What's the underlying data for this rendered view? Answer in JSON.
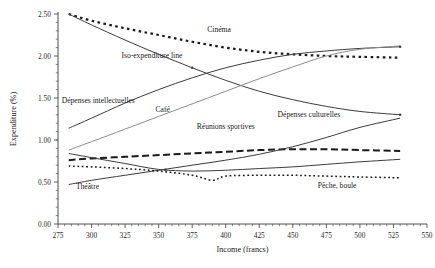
{
  "chart_data": {
    "type": "line",
    "title": "",
    "xlabel": "Income (francs)",
    "ylabel": "Expenditure (%)",
    "xlim": [
      275,
      550
    ],
    "ylim": [
      0.0,
      2.5
    ],
    "xticks": [
      275,
      300,
      325,
      350,
      375,
      400,
      425,
      450,
      475,
      500,
      525,
      550
    ],
    "yticks": [
      "0.00",
      "0.50",
      "1.00",
      "1.50",
      "2.00",
      "2.50"
    ],
    "ytick_values": [
      0.0,
      0.5,
      1.0,
      1.5,
      2.0,
      2.5
    ],
    "grid": false,
    "legend": "inline-annotations",
    "series": [
      {
        "name": "Cinéma",
        "style": "dotted-thick",
        "color": "#1a1a1a",
        "label_x": 395,
        "label_y": 2.28,
        "points": [
          [
            283,
            2.5
          ],
          [
            300,
            2.42
          ],
          [
            325,
            2.33
          ],
          [
            350,
            2.25
          ],
          [
            375,
            2.17
          ],
          [
            400,
            2.1
          ],
          [
            425,
            2.05
          ],
          [
            450,
            2.02
          ],
          [
            475,
            2.0
          ],
          [
            500,
            1.99
          ],
          [
            530,
            1.98
          ]
        ]
      },
      {
        "name": "Iso-expenditure line",
        "style": "solid",
        "color": "#3c3c3c",
        "label_x": 345,
        "label_y": 1.98,
        "points": [
          [
            283,
            2.5
          ],
          [
            300,
            2.37
          ],
          [
            325,
            2.19
          ],
          [
            350,
            2.02
          ],
          [
            375,
            1.86
          ],
          [
            400,
            1.71
          ],
          [
            425,
            1.58
          ],
          [
            450,
            1.48
          ],
          [
            475,
            1.4
          ],
          [
            500,
            1.34
          ],
          [
            530,
            1.3
          ]
        ]
      },
      {
        "name": "Dépenses intellectuelles",
        "style": "solid",
        "color": "#3c3c3c",
        "label_x": 305,
        "label_y": 1.44,
        "points": [
          [
            283,
            1.14
          ],
          [
            300,
            1.26
          ],
          [
            325,
            1.44
          ],
          [
            350,
            1.6
          ],
          [
            375,
            1.74
          ],
          [
            400,
            1.86
          ],
          [
            425,
            1.95
          ],
          [
            450,
            2.02
          ],
          [
            475,
            2.06
          ],
          [
            500,
            2.09
          ],
          [
            530,
            2.11
          ]
        ]
      },
      {
        "name": "Café",
        "style": "solid-light",
        "color": "#8d8d8d",
        "label_x": 353,
        "label_y": 1.33,
        "points": [
          [
            283,
            0.88
          ],
          [
            300,
            0.98
          ],
          [
            325,
            1.13
          ],
          [
            350,
            1.28
          ],
          [
            375,
            1.43
          ],
          [
            400,
            1.58
          ],
          [
            425,
            1.73
          ],
          [
            450,
            1.87
          ],
          [
            475,
            2.0
          ],
          [
            500,
            2.08
          ],
          [
            530,
            2.12
          ]
        ]
      },
      {
        "name": "Réunions sportives",
        "style": "dashed",
        "color": "#1a1a1a",
        "label_x": 400,
        "label_y": 1.13,
        "points": [
          [
            283,
            0.76
          ],
          [
            300,
            0.78
          ],
          [
            325,
            0.8
          ],
          [
            350,
            0.82
          ],
          [
            375,
            0.84
          ],
          [
            400,
            0.86
          ],
          [
            425,
            0.88
          ],
          [
            450,
            0.89
          ],
          [
            475,
            0.89
          ],
          [
            500,
            0.88
          ],
          [
            530,
            0.87
          ]
        ]
      },
      {
        "name": "Dépenses culturelles",
        "style": "solid",
        "color": "#3c3c3c",
        "label_x": 462,
        "label_y": 1.27,
        "points": [
          [
            283,
            0.47
          ],
          [
            300,
            0.52
          ],
          [
            325,
            0.58
          ],
          [
            350,
            0.64
          ],
          [
            375,
            0.7
          ],
          [
            400,
            0.76
          ],
          [
            425,
            0.83
          ],
          [
            450,
            0.92
          ],
          [
            475,
            1.03
          ],
          [
            500,
            1.15
          ],
          [
            530,
            1.26
          ]
        ]
      },
      {
        "name": "Théâtre",
        "style": "solid",
        "color": "#3c3c3c",
        "label_x": 297,
        "label_y": 0.42,
        "points": [
          [
            283,
            0.84
          ],
          [
            300,
            0.79
          ],
          [
            325,
            0.72
          ],
          [
            350,
            0.65
          ],
          [
            375,
            0.63
          ],
          [
            400,
            0.64
          ],
          [
            425,
            0.66
          ],
          [
            450,
            0.68
          ],
          [
            475,
            0.71
          ],
          [
            500,
            0.74
          ],
          [
            530,
            0.77
          ]
        ]
      },
      {
        "name": "Pêche, boule",
        "style": "dotted-fine",
        "color": "#1a1a1a",
        "label_x": 483,
        "label_y": 0.43,
        "points": [
          [
            283,
            0.69
          ],
          [
            300,
            0.68
          ],
          [
            325,
            0.66
          ],
          [
            350,
            0.63
          ],
          [
            375,
            0.58
          ],
          [
            390,
            0.52
          ],
          [
            400,
            0.57
          ],
          [
            425,
            0.58
          ],
          [
            450,
            0.58
          ],
          [
            475,
            0.57
          ],
          [
            500,
            0.56
          ],
          [
            530,
            0.55
          ]
        ]
      }
    ]
  }
}
